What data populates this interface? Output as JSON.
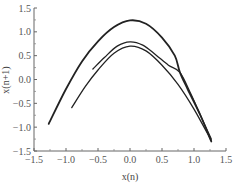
{
  "chart_data": {
    "type": "line",
    "title": "",
    "xlabel": "x(n)",
    "ylabel": "x(n+1)",
    "xlim": [
      -1.5,
      1.5
    ],
    "ylim": [
      -1.5,
      1.5
    ],
    "grid": false,
    "legend": null,
    "x_ticks": [
      "-1.5",
      "-1.0",
      "-0.5",
      "0.0",
      "0.5",
      "1.0",
      "1.5"
    ],
    "y_ticks": [
      "1.5",
      "1.0",
      "0.5",
      "0.0",
      "-0.5",
      "-1.0",
      "-1.5"
    ],
    "series": [
      {
        "name": "outer-branch",
        "points": [
          [
            -1.27,
            -0.93
          ],
          [
            -1.0,
            -0.2
          ],
          [
            -0.75,
            0.38
          ],
          [
            -0.5,
            0.8
          ],
          [
            -0.25,
            1.1
          ],
          [
            0.0,
            1.24
          ],
          [
            0.25,
            1.17
          ],
          [
            0.5,
            0.88
          ],
          [
            0.7,
            0.5
          ],
          [
            0.78,
            0.15
          ],
          [
            0.9,
            -0.2
          ],
          [
            1.1,
            -0.75
          ],
          [
            1.27,
            -1.3
          ]
        ]
      },
      {
        "name": "middle-upper-branch",
        "points": [
          [
            -0.58,
            0.22
          ],
          [
            -0.4,
            0.46
          ],
          [
            -0.2,
            0.7
          ],
          [
            0.0,
            0.79
          ],
          [
            0.2,
            0.72
          ],
          [
            0.4,
            0.52
          ],
          [
            0.6,
            0.3
          ],
          [
            0.78,
            0.15
          ],
          [
            0.95,
            -0.3
          ],
          [
            1.1,
            -0.75
          ],
          [
            1.27,
            -1.25
          ]
        ]
      },
      {
        "name": "middle-lower-branch",
        "points": [
          [
            -0.91,
            -0.59
          ],
          [
            -0.7,
            -0.15
          ],
          [
            -0.5,
            0.2
          ],
          [
            -0.25,
            0.55
          ],
          [
            0.0,
            0.7
          ],
          [
            0.25,
            0.6
          ],
          [
            0.5,
            0.3
          ],
          [
            0.75,
            -0.1
          ],
          [
            1.0,
            -0.62
          ],
          [
            1.27,
            -1.28
          ]
        ]
      }
    ]
  }
}
